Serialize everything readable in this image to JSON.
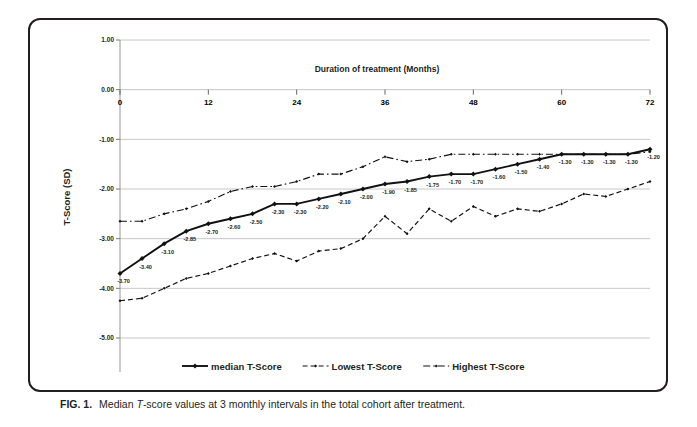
{
  "figure": {
    "caption_number": "FIG. 1.",
    "caption_pre": "Median ",
    "caption_italic": "T",
    "caption_post": "-score values at 3 monthly intervals in the total cohort after treatment."
  },
  "chart_data": {
    "type": "line",
    "title": "",
    "xlabel": "Duration of treatment (Months)",
    "ylabel": "T-Score (SD)",
    "xlim": [
      0,
      72
    ],
    "ylim": [
      -5.0,
      1.0
    ],
    "xticks": [
      0,
      12,
      24,
      36,
      48,
      60,
      72
    ],
    "xtick_labels": [
      "0",
      "12",
      "24",
      "36",
      "48",
      "60",
      "72"
    ],
    "yticks": [
      1.0,
      0.0,
      -1.0,
      -2.0,
      -3.0,
      -4.0,
      -5.0
    ],
    "ytick_labels": [
      "1.00",
      "0.00",
      "-1.00",
      "-2.00",
      "-3.00",
      "-4.00",
      "-5.00"
    ],
    "grid": true,
    "grid_axis": "y",
    "legend_position": "bottom",
    "x": [
      0,
      3,
      6,
      9,
      12,
      15,
      18,
      21,
      24,
      27,
      30,
      33,
      36,
      39,
      42,
      45,
      48,
      51,
      54,
      57,
      60,
      63,
      66,
      69,
      72
    ],
    "series": [
      {
        "name": "median T-Score",
        "style": "solid",
        "marker": "diamond",
        "values": [
          -3.7,
          -3.4,
          -3.1,
          -2.85,
          -2.7,
          -2.6,
          -2.5,
          -2.3,
          -2.3,
          -2.2,
          -2.1,
          -2.0,
          -1.9,
          -1.85,
          -1.75,
          -1.7,
          -1.7,
          -1.6,
          -1.5,
          -1.4,
          -1.3,
          -1.3,
          -1.3,
          -1.3,
          -1.2
        ],
        "data_labels": [
          "-3.70",
          "-3.40",
          "-3.10",
          "-2.85",
          "-2.70",
          "-2.60",
          "-2.50",
          "-2.30",
          "-2.30",
          "-2.20",
          "-2.10",
          "-2.00",
          "-1.90",
          "-1.85",
          "-1.75",
          "-1.70",
          "-1.70",
          "-1.60",
          "-1.50",
          "-1.40",
          "-1.30",
          "-1.30",
          "-1.30",
          "-1.30",
          "-1.20"
        ]
      },
      {
        "name": "Lowest T-Score",
        "style": "dashed",
        "marker": "small-diamond",
        "values": [
          -4.25,
          -4.2,
          -4.0,
          -3.8,
          -3.7,
          -3.55,
          -3.4,
          -3.3,
          -3.45,
          -3.25,
          -3.2,
          -3.0,
          -2.55,
          -2.9,
          -2.4,
          -2.65,
          -2.35,
          -2.55,
          -2.4,
          -2.45,
          -2.3,
          -2.1,
          -2.15,
          -2.0,
          -1.85
        ]
      },
      {
        "name": "Highest T-Score",
        "style": "dash-dot",
        "marker": "small-diamond",
        "values": [
          -2.65,
          -2.65,
          -2.5,
          -2.4,
          -2.25,
          -2.05,
          -1.95,
          -1.95,
          -1.85,
          -1.7,
          -1.7,
          -1.55,
          -1.35,
          -1.45,
          -1.4,
          -1.3,
          -1.3,
          -1.3,
          -1.3,
          -1.3,
          -1.3,
          -1.3,
          -1.3,
          -1.3,
          -1.25
        ]
      }
    ],
    "legend": [
      {
        "label": "median T-Score",
        "style": "solid"
      },
      {
        "label": "Lowest T-Score",
        "style": "dashed"
      },
      {
        "label": "Highest T-Score",
        "style": "dash-dot"
      }
    ]
  }
}
